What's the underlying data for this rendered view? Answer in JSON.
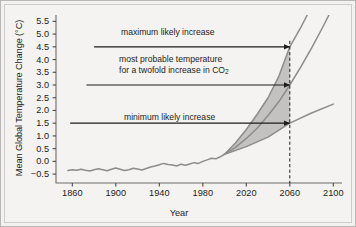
{
  "chart_data": {
    "type": "line",
    "title": "",
    "xlabel": "Year",
    "ylabel": "Mean Global Temperature Change (°C)",
    "xlim": [
      1845,
      2108
    ],
    "ylim": [
      -0.85,
      5.75
    ],
    "grid": false,
    "legend": "none",
    "xticks": [
      "1860",
      "1900",
      "1940",
      "1980",
      "2020",
      "2060",
      "2100"
    ],
    "xtick_values": [
      1860,
      1900,
      1940,
      1980,
      2020,
      2060,
      2100
    ],
    "yticks": [
      "5.5",
      "5.0",
      "4.5",
      "4.0",
      "3.5",
      "3.0",
      "2.5",
      "2.0",
      "1.5",
      "1.0",
      "0.5",
      "0.0",
      "−0.5"
    ],
    "ytick_values": [
      5.5,
      5.0,
      4.5,
      4.0,
      3.5,
      3.0,
      2.5,
      2.0,
      1.5,
      1.0,
      0.5,
      0.0,
      -0.5
    ],
    "series": [
      {
        "name": "observed record",
        "color": "#8c8c8c",
        "x": [
          1856,
          1860,
          1864,
          1868,
          1872,
          1876,
          1880,
          1884,
          1888,
          1892,
          1896,
          1900,
          1904,
          1908,
          1912,
          1916,
          1920,
          1924,
          1928,
          1932,
          1936,
          1940,
          1944,
          1948,
          1952,
          1956,
          1960,
          1964,
          1968,
          1972,
          1976,
          1980,
          1984,
          1988,
          1992,
          1996,
          2000
        ],
        "values": [
          -0.36,
          -0.33,
          -0.35,
          -0.31,
          -0.35,
          -0.38,
          -0.33,
          -0.29,
          -0.33,
          -0.37,
          -0.31,
          -0.26,
          -0.31,
          -0.36,
          -0.33,
          -0.27,
          -0.3,
          -0.34,
          -0.28,
          -0.22,
          -0.18,
          -0.13,
          -0.08,
          -0.12,
          -0.14,
          -0.18,
          -0.11,
          -0.15,
          -0.1,
          -0.05,
          -0.08,
          0.0,
          0.06,
          0.12,
          0.1,
          0.18,
          0.28
        ]
      },
      {
        "name": "maximum likely increase",
        "color": "#8c8c8c",
        "x": [
          2000,
          2010,
          2020,
          2030,
          2040,
          2050,
          2060,
          2070,
          2076
        ],
        "values": [
          0.28,
          0.72,
          1.25,
          1.85,
          2.5,
          3.35,
          4.5,
          5.25,
          5.75
        ]
      },
      {
        "name": "most probable temperature for a twofold increase in CO2",
        "color": "#8c8c8c",
        "x": [
          2000,
          2010,
          2020,
          2030,
          2040,
          2050,
          2060,
          2070,
          2080,
          2090,
          2096
        ],
        "values": [
          0.28,
          0.55,
          0.9,
          1.3,
          1.8,
          2.35,
          3.0,
          3.7,
          4.45,
          5.25,
          5.75
        ]
      },
      {
        "name": "minimum likely increase",
        "color": "#8c8c8c",
        "x": [
          2000,
          2020,
          2040,
          2060,
          2080,
          2100
        ],
        "values": [
          0.28,
          0.58,
          0.95,
          1.5,
          1.9,
          2.25
        ]
      }
    ],
    "shaded_band": {
      "label": "likely range",
      "color": "#c3c2c0",
      "from_year": 2000,
      "to_year": 2060,
      "upper_series": "maximum likely increase",
      "lower_series": "minimum likely increase"
    },
    "reference_line": {
      "label": "2060",
      "year": 2060,
      "style": "dashed",
      "color": "#1d1d1b"
    },
    "annotations": [
      {
        "id": "max",
        "text": "maximum likely increase",
        "arrow_from_year": 1880,
        "arrow_to_year": 2060,
        "value": 4.5
      },
      {
        "id": "probable",
        "text_line1": "most probable temperature",
        "text_line2_pre": "for a twofold increase in CO",
        "text_line2_sub": "2",
        "arrow_from_year": 1873,
        "arrow_to_year": 2060,
        "value": 3.0
      },
      {
        "id": "min",
        "text": "minimum likely increase",
        "arrow_from_year": 1858,
        "arrow_to_year": 2060,
        "value": 1.5
      }
    ]
  }
}
